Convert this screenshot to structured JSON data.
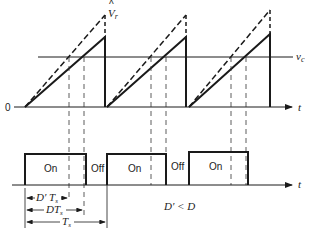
{
  "diagram": {
    "type": "pwm-waveform",
    "colors": {
      "ink": "#1a1a1a",
      "dashed": "#333333",
      "background": "#ffffff"
    },
    "upper_plot": {
      "origin_label": "0",
      "time_axis_label": "t",
      "control_voltage_label": "v",
      "control_voltage_sub": "c",
      "peak_label": "V",
      "peak_label_hat": "^",
      "peak_label_sub": "r",
      "ramps": [
        {
          "start_x": 25,
          "peak_x": 105,
          "solid_peak_y": 37,
          "dashed_peak_y": 15,
          "cross_dashed_x": 69,
          "cross_solid_x": 84
        },
        {
          "start_x": 107,
          "peak_x": 186,
          "solid_peak_y": 37,
          "dashed_peak_y": 15,
          "cross_dashed_x": 151,
          "cross_solid_x": 166
        },
        {
          "start_x": 189,
          "peak_x": 270,
          "solid_peak_y": 37,
          "dashed_peak_y": 15,
          "cross_dashed_x": 231,
          "cross_solid_x": 246
        }
      ]
    },
    "lower_plot": {
      "time_axis_label": "t",
      "pulses": [
        {
          "on_label": "On",
          "start_x": 25,
          "end_x": 86
        },
        {
          "on_label": "On",
          "start_x": 107,
          "end_x": 166
        },
        {
          "on_label": "On",
          "start_x": 189,
          "end_x": 248
        }
      ],
      "off_labels": [
        "Off",
        "Off"
      ]
    },
    "dimensions": {
      "d_prime_ts": {
        "main": "D′ T",
        "sub": "s"
      },
      "d_ts": {
        "main": "DT",
        "sub": "s"
      },
      "ts": {
        "main": "T",
        "sub": "s"
      }
    },
    "relation_label": "D′ < D"
  }
}
